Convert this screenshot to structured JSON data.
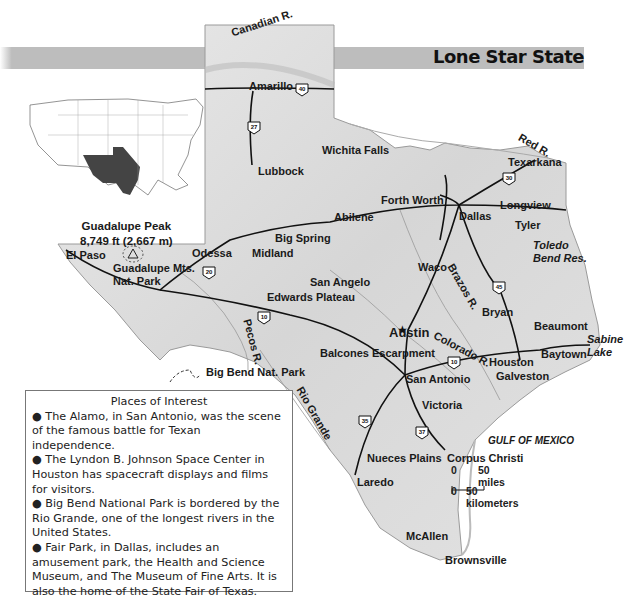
{
  "title": "Lone Star State",
  "inset": {
    "name": "us-locator-map",
    "highlight": "Texas",
    "highlight_color": "#444444"
  },
  "peak": {
    "name": "Guadalupe Peak",
    "elevation": "8,749 ft (2,667 m)"
  },
  "cities": [
    {
      "name": "Amarillo",
      "x": 249,
      "y": 81
    },
    {
      "name": "Lubbock",
      "x": 258,
      "y": 166
    },
    {
      "name": "Wichita Falls",
      "x": 322,
      "y": 145
    },
    {
      "name": "Texarkana",
      "x": 508,
      "y": 157
    },
    {
      "name": "Forth Worth",
      "x": 381,
      "y": 195
    },
    {
      "name": "Longview",
      "x": 500,
      "y": 200
    },
    {
      "name": "Abilene",
      "x": 334,
      "y": 212
    },
    {
      "name": "Dallas",
      "x": 459,
      "y": 211
    },
    {
      "name": "Tyler",
      "x": 515,
      "y": 220
    },
    {
      "name": "Big Spring",
      "x": 275,
      "y": 233
    },
    {
      "name": "Odessa",
      "x": 192,
      "y": 248
    },
    {
      "name": "Midland",
      "x": 252,
      "y": 248
    },
    {
      "name": "El Paso",
      "x": 66,
      "y": 250
    },
    {
      "name": "Waco",
      "x": 418,
      "y": 262
    },
    {
      "name": "San Angelo",
      "x": 310,
      "y": 277
    },
    {
      "name": "Bryan",
      "x": 482,
      "y": 307
    },
    {
      "name": "Edwards Plateau",
      "x": 267,
      "y": 292
    },
    {
      "name": "Beaumont",
      "x": 534,
      "y": 321
    },
    {
      "name": "Baytown",
      "x": 541,
      "y": 349
    },
    {
      "name": "Houston",
      "x": 489,
      "y": 357
    },
    {
      "name": "Balcones Escarpment",
      "x": 320,
      "y": 348
    },
    {
      "name": "San Antonio",
      "x": 406,
      "y": 374
    },
    {
      "name": "Galveston",
      "x": 496,
      "y": 371
    },
    {
      "name": "Victoria",
      "x": 422,
      "y": 400
    },
    {
      "name": "Nueces Plains",
      "x": 367,
      "y": 453
    },
    {
      "name": "Corpus Christi",
      "x": 447,
      "y": 453
    },
    {
      "name": "Laredo",
      "x": 357,
      "y": 477
    },
    {
      "name": "McAllen",
      "x": 406,
      "y": 531
    },
    {
      "name": "Brownsville",
      "x": 445,
      "y": 555
    }
  ],
  "capital": {
    "name": "Austin",
    "x": 389,
    "y": 333
  },
  "parks": [
    {
      "name": "Guadalupe Mts.",
      "line2": "Nat. Park"
    },
    {
      "name": "Big Bend Nat. Park"
    }
  ],
  "water": {
    "canadian": "Canadian R.",
    "red": "Red R.",
    "pecos": "Pecos R.",
    "rio_grande": "Rio Grande",
    "brazos": "Brazos R.",
    "colorado": "Colorado R.",
    "toledo": "Toledo",
    "toledo2": "Bend Res.",
    "sabine": "Sabine",
    "sabine2": "Lake",
    "gulf": "GULF OF MEXICO"
  },
  "highways": [
    "40",
    "27",
    "30",
    "20",
    "45",
    "10",
    "10",
    "35",
    "37"
  ],
  "scale": {
    "zero_mi": "0",
    "miles": "50 miles",
    "zero_km": "0",
    "km": "50 kilometers"
  },
  "places_of_interest": {
    "heading": "Places of Interest",
    "items": [
      "The Alamo, in San Antonio, was the scene of the famous battle for Texan independence.",
      "The Lyndon B. Johnson Space Center in Houston has spacecraft displays and films for visitors.",
      "Big Bend National Park is bordered by the Rio Grande, one of the longest rivers in the United States.",
      "Fair Park, in Dallas, includes an amusement park, the Health and Science Museum, and The Museum of Fine Arts. It is also the home of the State Fair of Texas."
    ]
  }
}
